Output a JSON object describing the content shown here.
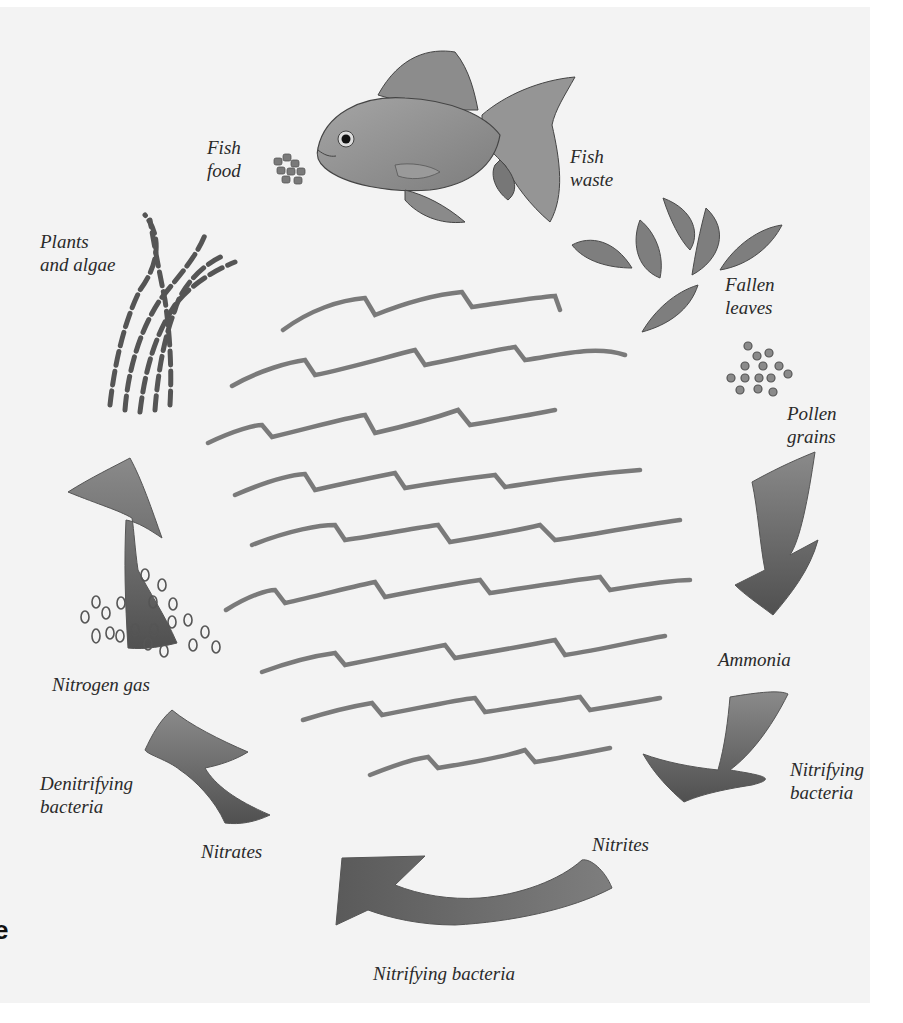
{
  "diagram": {
    "type": "cycle",
    "colors": {
      "background": "#f3f3f3",
      "page": "#ffffff",
      "ink": "#2a2a2a",
      "arrow": "#6e6e6e",
      "arrow_dark": "#555555",
      "water": "#7a7a7a"
    },
    "labels": {
      "fish_food": "Fish\nfood",
      "fish_waste": "Fish\nwaste",
      "plants_algae": "Plants\nand algae",
      "fallen_leaves": "Fallen\nleaves",
      "pollen_grains": "Pollen\ngrains",
      "ammonia": "Ammonia",
      "nitrifying_bacteria_right": "Nitrifying\nbacteria",
      "nitrites": "Nitrites",
      "nitrifying_bacteria_bottom": "Nitrifying bacteria",
      "nitrates": "Nitrates",
      "denitrifying_bacteria": "Denitrifying\nbacteria",
      "nitrogen_gas": "Nitrogen gas"
    },
    "edge_glyph": "e",
    "cycle_sequence": [
      "Fish food",
      "Fish waste",
      "Fallen leaves",
      "Pollen grains",
      "Ammonia",
      "Nitrifying bacteria",
      "Nitrites",
      "Nitrifying bacteria",
      "Nitrates",
      "Denitrifying bacteria",
      "Nitrogen gas",
      "Plants and algae"
    ]
  }
}
